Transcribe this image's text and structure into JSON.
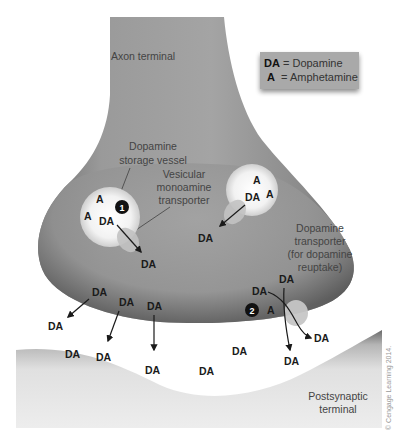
{
  "labels": {
    "axon_terminal": "Axon terminal",
    "storage_vessel": [
      "Dopamine",
      "storage vessel"
    ],
    "vmat": [
      "Vesicular",
      "monoamine",
      "transporter"
    ],
    "dat": [
      "Dopamine",
      "transporter",
      "(for dopamine",
      "reuptake)"
    ],
    "postsynaptic": [
      "Postsynaptic",
      "terminal"
    ]
  },
  "legend": {
    "items": [
      {
        "abbr": "DA",
        "sep": " = ",
        "name": "Dopamine"
      },
      {
        "abbr": "A",
        "sep": "  = ",
        "name": "Amphetamine"
      }
    ]
  },
  "steps": [
    "1",
    "2"
  ],
  "molecules": {
    "da": "DA",
    "a": "A"
  },
  "copyright": "© Cengage Learning 2014.",
  "colors": {
    "terminal": "#8c8c8c",
    "vesicle": "#f4f4f4",
    "transporter": "#c4c4c4",
    "legend_bg": "#a8a8a8"
  }
}
